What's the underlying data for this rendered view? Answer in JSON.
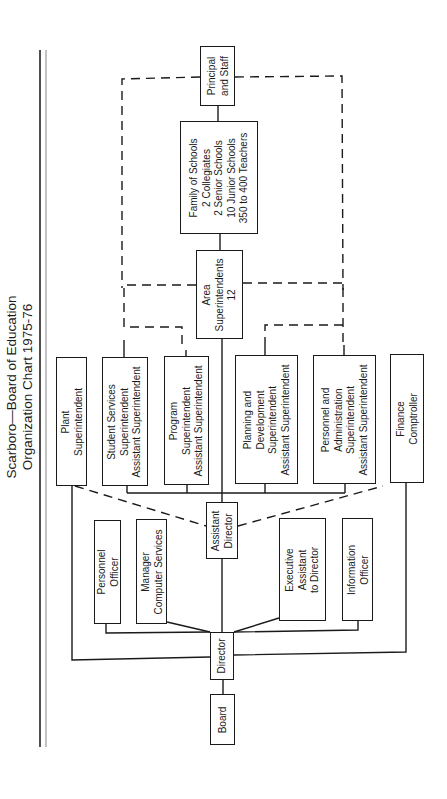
{
  "title": {
    "line1": "Scarboro—Board of Education",
    "line2": "Organization Chart 1975-76"
  },
  "nodes": {
    "principal": {
      "lines": [
        "Principal",
        "and Staff"
      ]
    },
    "family": {
      "lines": [
        "Family of Schools",
        "2 Collegiates",
        "2 Senior Schools",
        "10 Junior Schools",
        "350 to 400 Teachers"
      ]
    },
    "area": {
      "lines": [
        "Area",
        "Superintendents",
        "12"
      ]
    },
    "plant": {
      "lines": [
        "Plant",
        "Superintendent"
      ]
    },
    "student": {
      "lines": [
        "Student Services",
        "Superintendent",
        "Assistant Superintendent"
      ]
    },
    "program": {
      "lines": [
        "Program",
        "Superintendent",
        "Assistant Superintendent"
      ]
    },
    "planning": {
      "lines": [
        "Planning and",
        "Development",
        "Superintendent",
        "Assistant Superintendent"
      ]
    },
    "personnel_admin": {
      "lines": [
        "Personnel and",
        "Administration",
        "Superintendent",
        "Assistant Superintendent"
      ]
    },
    "finance": {
      "lines": [
        "Finance",
        "Comptroller"
      ]
    },
    "assistant_director": {
      "lines": [
        "Assistant",
        "Director"
      ]
    },
    "personnel_officer": {
      "lines": [
        "Personnel",
        "Officer"
      ]
    },
    "computer": {
      "lines": [
        "Manager",
        "Computer Services"
      ]
    },
    "executive": {
      "lines": [
        "Executive",
        "Assistant",
        "to Director"
      ]
    },
    "information": {
      "lines": [
        "Information",
        "Officer"
      ]
    },
    "director": {
      "lines": [
        "Director"
      ]
    },
    "board": {
      "lines": [
        "Board"
      ]
    }
  },
  "colors": {
    "line": "#1a1a1a",
    "rule_dark": "#222222",
    "rule_light": "#9a9a9a",
    "background": "#ffffff"
  }
}
